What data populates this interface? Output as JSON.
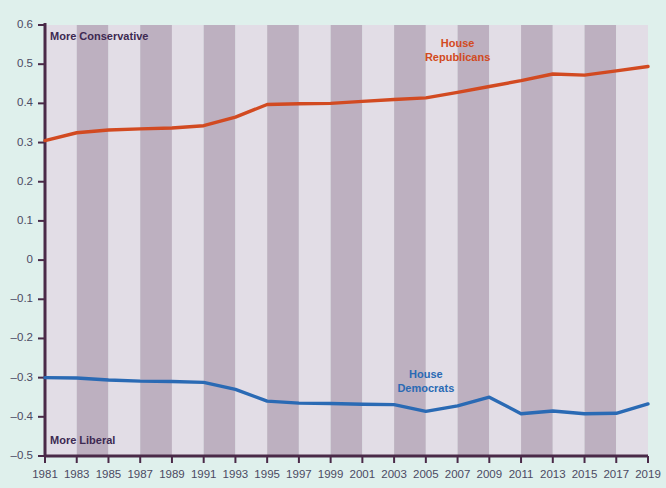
{
  "figure": {
    "background_color": "#dff0ec",
    "axis_color": "#4a2a48",
    "band_light": "#e2dde6",
    "band_dark": "#bdb0c0",
    "tick_label_color": "#4b4a63"
  },
  "annotations": {
    "more_conservative": "More Conservative",
    "more_liberal": "More Liberal"
  },
  "chart_data": {
    "type": "line",
    "title": "",
    "subtitle": "",
    "xlabel": "",
    "ylabel": "",
    "xlim": [
      1981,
      2019
    ],
    "ylim": [
      -0.5,
      0.6
    ],
    "grid": false,
    "legend_position": "inline-on-series",
    "yticks": [
      0.6,
      0.5,
      0.4,
      0.3,
      0.2,
      0.1,
      0,
      -0.1,
      -0.2,
      -0.3,
      -0.4,
      -0.5
    ],
    "ytick_labels": [
      "0.6",
      "0.5",
      "0.4",
      "0.3",
      "0.2",
      "0.1",
      "0",
      "-0.1",
      "-0.2",
      "-0.3",
      "-0.4",
      "-0.5"
    ],
    "x": [
      1981,
      1983,
      1985,
      1987,
      1989,
      1991,
      1993,
      1995,
      1997,
      1999,
      2001,
      2003,
      2005,
      2007,
      2009,
      2011,
      2013,
      2015,
      2017,
      2019
    ],
    "xtick_labels": [
      "1981",
      "1983",
      "1985",
      "1987",
      "1989",
      "1991",
      "1993",
      "1995",
      "1997",
      "1999",
      "2001",
      "2003",
      "2005",
      "2007",
      "2009",
      "2011",
      "2013",
      "2015",
      "2017",
      "2019"
    ],
    "series": [
      {
        "name": "House Republicans",
        "color": "#d24a21",
        "label_x": 2007,
        "label_y": 0.545,
        "values": [
          0.305,
          0.325,
          0.332,
          0.335,
          0.337,
          0.343,
          0.365,
          0.397,
          0.399,
          0.4,
          0.405,
          0.41,
          0.414,
          0.428,
          0.443,
          0.458,
          0.475,
          0.472,
          0.483,
          0.494
        ]
      },
      {
        "name": "House Democrats",
        "color": "#2a6ab4",
        "label_x": 2005,
        "label_y": -0.3,
        "values": [
          -0.3,
          -0.301,
          -0.306,
          -0.309,
          -0.31,
          -0.312,
          -0.33,
          -0.36,
          -0.365,
          -0.366,
          -0.368,
          -0.369,
          -0.386,
          -0.372,
          -0.35,
          -0.392,
          -0.385,
          -0.392,
          -0.391,
          -0.367
        ]
      }
    ]
  }
}
